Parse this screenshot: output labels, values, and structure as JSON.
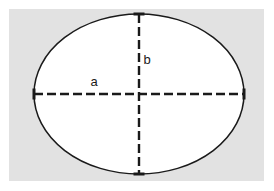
{
  "figure": {
    "type": "geometry-diagram",
    "shape_name": "ellipse",
    "canvas": {
      "width": 274,
      "height": 191,
      "background_color": "#ffffff"
    },
    "panel": {
      "x": 9,
      "y": 9,
      "width": 255,
      "height": 172,
      "fill_color": "#e2e2e2"
    },
    "ellipse": {
      "center_x": 139,
      "center_y": 94,
      "semi_major_a": 105,
      "semi_minor_b": 80,
      "fill_color": "#ffffff",
      "stroke_color": "#1a1a1a",
      "stroke_width": 1.5
    },
    "axes": {
      "stroke_color": "#1a1a1a",
      "stroke_width": 2.4,
      "dash_pattern": "9 4",
      "cap_length": 11,
      "cap_width": 3,
      "major": {
        "x1": 34,
        "y1": 94,
        "x2": 244,
        "y2": 94,
        "label": "a",
        "label_x": 94,
        "label_y": 83
      },
      "minor": {
        "x1": 139,
        "y1": 14,
        "x2": 139,
        "y2": 174,
        "label": "b",
        "label_x": 147,
        "label_y": 61
      }
    },
    "vertices": [
      {
        "name": "left-vertex",
        "x": 34,
        "y": 94,
        "orientation": "vertical"
      },
      {
        "name": "right-vertex",
        "x": 244,
        "y": 94,
        "orientation": "vertical"
      },
      {
        "name": "top-vertex",
        "x": 139,
        "y": 14,
        "orientation": "horizontal"
      },
      {
        "name": "bottom-vertex",
        "x": 139,
        "y": 174,
        "orientation": "horizontal"
      }
    ]
  }
}
